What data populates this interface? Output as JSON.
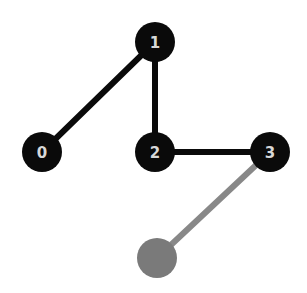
{
  "diagram": {
    "type": "graph",
    "nodes": [
      {
        "id": "0",
        "label": "0",
        "x": 42,
        "y": 152,
        "r": 20,
        "fill": "#0a0a0a",
        "text_color": "#d8d8d8"
      },
      {
        "id": "1",
        "label": "1",
        "x": 155,
        "y": 42,
        "r": 20,
        "fill": "#0a0a0a",
        "text_color": "#d8d8d8"
      },
      {
        "id": "2",
        "label": "2",
        "x": 155,
        "y": 152,
        "r": 20,
        "fill": "#0a0a0a",
        "text_color": "#d8d8d8"
      },
      {
        "id": "3",
        "label": "3",
        "x": 270,
        "y": 152,
        "r": 20,
        "fill": "#0a0a0a",
        "text_color": "#d8d8d8"
      },
      {
        "id": "4",
        "label": "",
        "x": 157,
        "y": 258,
        "r": 20,
        "fill": "#7a7a7a",
        "text_color": "#d8d8d8"
      }
    ],
    "edges": [
      {
        "from": "1",
        "to": "0",
        "color": "#0a0a0a",
        "width": 6
      },
      {
        "from": "1",
        "to": "2",
        "color": "#0a0a0a",
        "width": 6
      },
      {
        "from": "2",
        "to": "3",
        "color": "#0a0a0a",
        "width": 6
      },
      {
        "from": "3",
        "to": "4",
        "color": "#888888",
        "width": 6
      }
    ]
  }
}
